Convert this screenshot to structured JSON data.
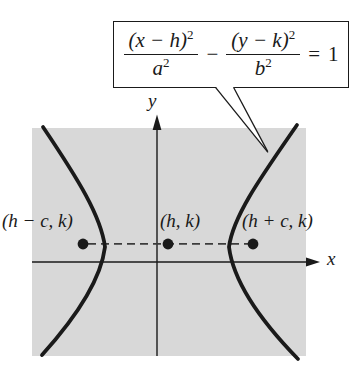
{
  "callout": {
    "equation": {
      "num1_base": "(x − h)",
      "num1_exp": "2",
      "den1_base": "a",
      "den1_exp": "2",
      "operator_minus": "−",
      "num2_base": "(y − k)",
      "num2_exp": "2",
      "den2_base": "b",
      "den2_exp": "2",
      "equals_sign": "=",
      "rhs_value": "1"
    }
  },
  "axes": {
    "x_label": "x",
    "y_label": "y"
  },
  "points": {
    "left_focus_label": "(h − c, k)",
    "center_label": "(h, k)",
    "right_focus_label": "(h + c, k)"
  },
  "colors": {
    "plot_background": "#d8d8d8",
    "line_color": "#1a1a1a",
    "dashed_line_color": "#3c3c3c",
    "page_background": "#ffffff"
  }
}
